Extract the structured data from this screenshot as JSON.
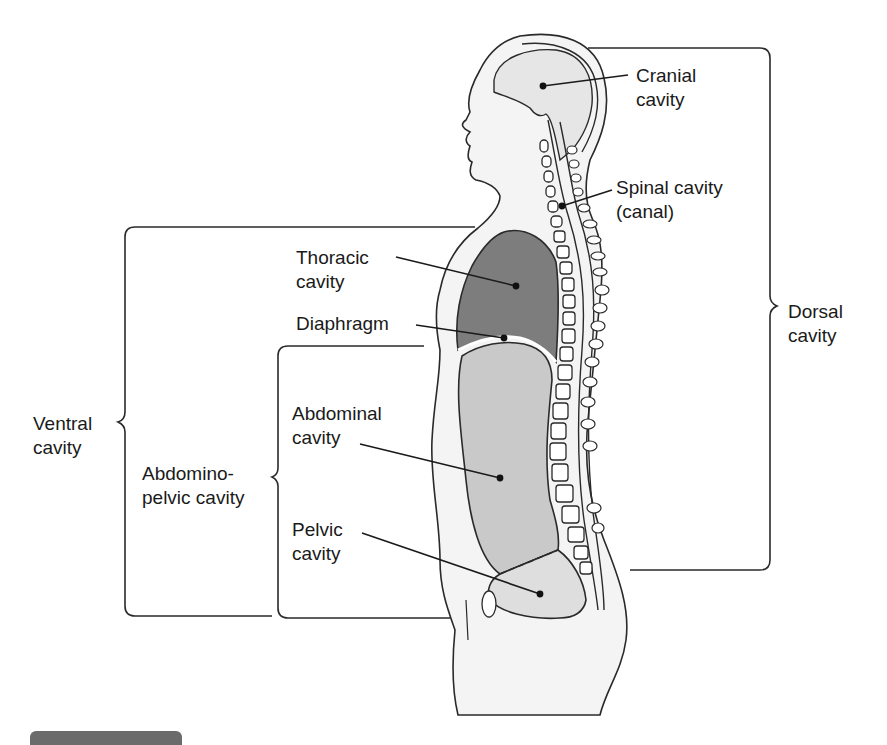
{
  "diagram": {
    "colors": {
      "outline": "#2a2a2a",
      "body_fill": "#f4f4f4",
      "cranial_fill": "#e6e6e6",
      "thoracic_fill": "#7d7d7d",
      "abdominal_fill": "#c9c9c9",
      "pelvic_fill": "#dedede",
      "bar": "#6b6b6b"
    },
    "labels": {
      "cranial": {
        "line1": "Cranial",
        "line2": "cavity"
      },
      "spinal": {
        "line1": "Spinal cavity",
        "line2": "(canal)"
      },
      "thoracic": {
        "line1": "Thoracic",
        "line2": "cavity"
      },
      "diaphragm": {
        "line1": "Diaphragm"
      },
      "dorsal": {
        "line1": "Dorsal",
        "line2": "cavity"
      },
      "ventral": {
        "line1": "Ventral",
        "line2": "cavity"
      },
      "abdominal": {
        "line1": "Abdominal",
        "line2": "cavity"
      },
      "abdominopelvic": {
        "line1": "Abdomino-",
        "line2": "pelvic cavity"
      },
      "pelvic": {
        "line1": "Pelvic",
        "line2": "cavity"
      }
    },
    "brackets": [
      {
        "name": "dorsal",
        "spans": [
          "cranial",
          "spinal"
        ]
      },
      {
        "name": "ventral",
        "spans": [
          "thoracic",
          "abdominopelvic"
        ]
      },
      {
        "name": "abdominopelvic",
        "spans": [
          "abdominal",
          "pelvic"
        ]
      }
    ]
  }
}
